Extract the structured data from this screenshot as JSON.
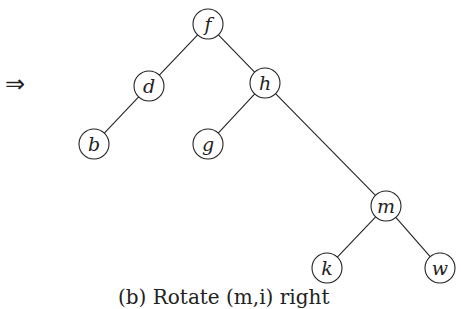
{
  "arrow": "⇒",
  "caption": "(b) Rotate (m,i) right",
  "tree": {
    "nodes": [
      {
        "id": "f",
        "label": "f",
        "x": 208,
        "y": 24
      },
      {
        "id": "d",
        "label": "d",
        "x": 149,
        "y": 86
      },
      {
        "id": "h",
        "label": "h",
        "x": 265,
        "y": 83
      },
      {
        "id": "b",
        "label": "b",
        "x": 94,
        "y": 144
      },
      {
        "id": "g",
        "label": "g",
        "x": 208,
        "y": 144
      },
      {
        "id": "m",
        "label": "m",
        "x": 386,
        "y": 206
      },
      {
        "id": "k",
        "label": "k",
        "x": 327,
        "y": 268
      },
      {
        "id": "w",
        "label": "w",
        "x": 440,
        "y": 268
      }
    ],
    "edges": [
      [
        "f",
        "d"
      ],
      [
        "f",
        "h"
      ],
      [
        "d",
        "b"
      ],
      [
        "h",
        "g"
      ],
      [
        "h",
        "m"
      ],
      [
        "m",
        "k"
      ],
      [
        "m",
        "w"
      ]
    ],
    "radius": 15
  }
}
